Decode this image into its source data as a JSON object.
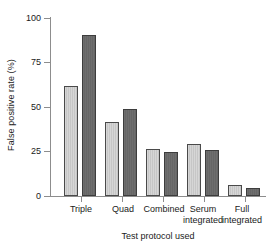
{
  "chart_data": {
    "type": "bar",
    "title": "",
    "xlabel": "Test protocol used",
    "ylabel": "False positive rate (%)",
    "categories": [
      "Triple",
      "Quad",
      "Combined",
      "Serum\nintegrated",
      "Full\nintegrated"
    ],
    "series": [
      {
        "name": "light",
        "color": "#d0d0d0",
        "values": [
          62,
          41.5,
          26.5,
          29,
          6
        ]
      },
      {
        "name": "dark",
        "color": "#6b6b6b",
        "values": [
          90.5,
          49,
          24.5,
          26,
          4.5
        ]
      }
    ],
    "ylim": [
      0,
      100
    ],
    "yticks": [
      0,
      25,
      50,
      75,
      100
    ],
    "ytick_labels": [
      "0",
      "25",
      "50",
      "75",
      "100"
    ],
    "grid": false,
    "legend": "none"
  },
  "axis": {
    "y_title": "False positive rate (%)",
    "x_title": "Test protocol used",
    "y_labels": [
      "100",
      "75",
      "50",
      "25",
      "0"
    ]
  }
}
